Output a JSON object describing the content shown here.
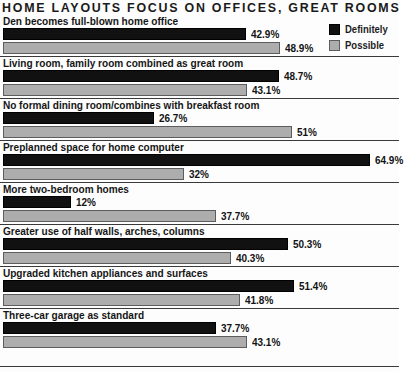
{
  "title": "HOME LAYOUTS FOCUS ON OFFICES, GREAT ROOMS",
  "legend": {
    "items": [
      {
        "label": "Definitely",
        "color": "#111111"
      },
      {
        "label": "Possible",
        "color": "#adadad"
      }
    ]
  },
  "chart_data": {
    "type": "bar",
    "title": "HOME LAYOUTS FOCUS ON OFFICES, GREAT ROOMS",
    "orientation": "horizontal",
    "xlabel": "",
    "ylabel": "",
    "xlim": [
      0,
      70
    ],
    "grid": false,
    "legend_position": "top-right",
    "categories": [
      "Den becomes full-blown home office",
      "Living room, family room combined as great room",
      "No formal dining room/combines with breakfast room",
      "Preplanned space for home computer",
      "More two-bedroom homes",
      "Greater use of half walls, arches, columns",
      "Upgraded kitchen appliances and surfaces",
      "Three-car garage as standard"
    ],
    "series": [
      {
        "name": "Definitely",
        "color": "#111111",
        "values": [
          42.9,
          48.7,
          26.7,
          64.9,
          12,
          50.3,
          51.4,
          37.7
        ],
        "labels": [
          "42.9%",
          "48.7%",
          "26.7%",
          "64.9%",
          "12%",
          "50.3%",
          "51.4%",
          "37.7%"
        ]
      },
      {
        "name": "Possible",
        "color": "#adadad",
        "values": [
          48.9,
          43.1,
          51,
          32,
          37.7,
          40.3,
          41.8,
          43.1
        ],
        "labels": [
          "48.9%",
          "43.1%",
          "51%",
          "32%",
          "37.7%",
          "40.3%",
          "41.8%",
          "43.1%"
        ]
      }
    ]
  }
}
